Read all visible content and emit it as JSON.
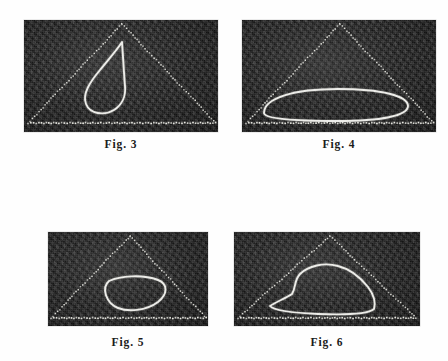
{
  "plate": {
    "background_color": "#fefefe",
    "panel_background_color": "#2c2c2c",
    "trace_color": "#f2f2ee",
    "guide_color": "#e8e8e2",
    "figures": [
      {
        "id": "fig-3",
        "caption": "Fig. 3",
        "panel": {
          "x": 24,
          "y": 20,
          "width": 194,
          "height": 112
        },
        "caption_pos": {
          "x": 24,
          "y": 138,
          "width": 194
        },
        "guide_triangle": {
          "style": "dotted",
          "apex": [
            98,
            4
          ],
          "left_base": [
            6,
            101
          ],
          "right_base": [
            190,
            101
          ]
        },
        "baseline": {
          "style": "dotted",
          "from": [
            4,
            103
          ],
          "to": [
            192,
            103
          ]
        },
        "trace": {
          "shape": "teardrop-heart",
          "description": "bright closed teardrop / heart-shaped loop with cusp near apex, broken arcs",
          "path": "M 98 22 C 93 30 84 40 76 50 C 66 62 58 74 62 84 C 66 94 80 96 90 90 C 98 85 102 76 101 66 C 100 54 99 36 98 22 Z"
        }
      },
      {
        "id": "fig-4",
        "caption": "Fig. 4",
        "panel": {
          "x": 242,
          "y": 20,
          "width": 194,
          "height": 112
        },
        "caption_pos": {
          "x": 242,
          "y": 138,
          "width": 194
        },
        "guide_triangle": {
          "style": "dotted",
          "apex": [
            98,
            4
          ],
          "left_base": [
            6,
            101
          ],
          "right_base": [
            190,
            101
          ]
        },
        "baseline": {
          "style": "dotted",
          "from": [
            4,
            103
          ],
          "to": [
            192,
            103
          ]
        },
        "trace": {
          "shape": "ellipse",
          "description": "wide flattened ellipse lying along the base of the triangle",
          "path": "M 22 93 C 22 78 52 69 96 69 C 140 69 166 76 166 86 C 166 96 138 101 96 101 C 52 101 22 99 22 93 Z"
        }
      },
      {
        "id": "fig-5",
        "caption": "Fig. 5",
        "panel": {
          "x": 48,
          "y": 232,
          "width": 160,
          "height": 94
        },
        "caption_pos": {
          "x": 48,
          "y": 336,
          "width": 160
        },
        "guide_triangle": {
          "style": "dotted",
          "apex": [
            82,
            4
          ],
          "left_base": [
            5,
            84
          ],
          "right_base": [
            156,
            84
          ]
        },
        "baseline": {
          "style": "dotted",
          "from": [
            3,
            86
          ],
          "to": [
            158,
            86
          ]
        },
        "trace": {
          "shape": "rounded-triangle-lobe",
          "description": "small rounded triangular closed loop right of centre, near the base",
          "path": "M 61 49 C 72 44 94 42 110 48 C 120 52 120 62 110 70 C 98 79 80 80 70 76 C 58 71 53 56 61 49 Z"
        }
      },
      {
        "id": "fig-6",
        "caption": "Fig. 6",
        "panel": {
          "x": 234,
          "y": 232,
          "width": 186,
          "height": 94
        },
        "caption_pos": {
          "x": 234,
          "y": 336,
          "width": 186
        },
        "guide_triangle": {
          "style": "dotted",
          "apex": [
            96,
            4
          ],
          "left_base": [
            6,
            84
          ],
          "right_base": [
            180,
            84
          ]
        },
        "baseline": {
          "style": "dotted",
          "from": [
            4,
            86
          ],
          "to": [
            182,
            86
          ]
        },
        "trace": {
          "shape": "irregular-blob",
          "description": "wide irregular closed curve with a raised hump on the left and a long flat bottom on the base",
          "path": "M 36 74 C 42 70 52 66 58 62 C 62 56 60 48 66 42 C 74 34 90 30 104 34 C 116 37 126 45 134 55 C 140 63 142 70 140 77 C 134 82 110 83 84 82 C 62 81 40 79 36 74 Z"
        }
      }
    ]
  }
}
